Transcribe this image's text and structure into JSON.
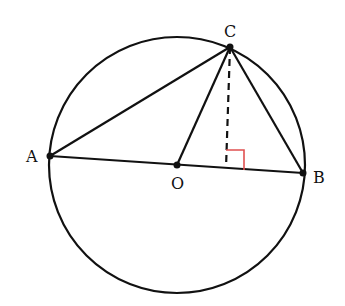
{
  "diagram": {
    "circle": {
      "cx": 177,
      "cy": 165,
      "r": 128
    },
    "points": {
      "A": {
        "label": "A",
        "x": 50,
        "y": 156
      },
      "B": {
        "label": "B",
        "x": 303,
        "y": 173
      },
      "C": {
        "label": "C",
        "x": 230,
        "y": 47
      },
      "O": {
        "label": "O",
        "x": 177,
        "y": 165
      }
    },
    "segments": [
      "AB",
      "AC",
      "BC",
      "OC"
    ],
    "dashed": "C to foot of perpendicular on AB",
    "right_angle_color": "#e05050",
    "line_color": "#111111"
  }
}
